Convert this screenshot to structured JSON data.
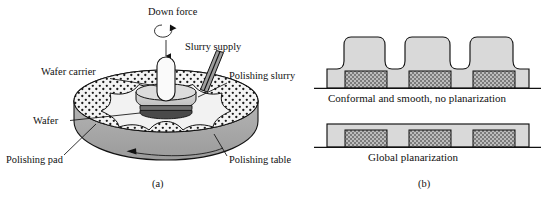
{
  "figure": {
    "panels": [
      {
        "id": "a",
        "caption": "(a)"
      },
      {
        "id": "b",
        "caption": "(b)"
      }
    ]
  },
  "panel_a": {
    "caption": "(a)",
    "labels": {
      "down_force": "Down force",
      "slurry_supply": "Slurry supply",
      "polishing_slurry": "Polishing slurry",
      "wafer_carrier": "Wafer carrier",
      "wafer": "Wafer",
      "polishing_pad": "Polishing pad",
      "polishing_table": "Polishing table"
    },
    "icons": {
      "rotation": "rotation-arrow-icon",
      "down_arrow": "down-arrow-icon",
      "table_rotation": "table-rotation-arrow-icon"
    }
  },
  "panel_b": {
    "caption": "(b)",
    "profiles": [
      {
        "id": "conformal",
        "caption": "Conformal and smooth, no planarization"
      },
      {
        "id": "planarized",
        "caption": "Global planarization"
      }
    ],
    "feature_count": 3
  },
  "colors": {
    "outline": "#111111",
    "film_fill": "#d9d9d9",
    "feature_fill": "#9a9a9a",
    "pad_top": "#f2f2f2",
    "table_side": "#a8a8a8",
    "carrier_fill": "#cfcfcf",
    "spindle_fill": "#fafafa",
    "nozzle_fill": "#a0a0a0",
    "background": "#ffffff"
  }
}
